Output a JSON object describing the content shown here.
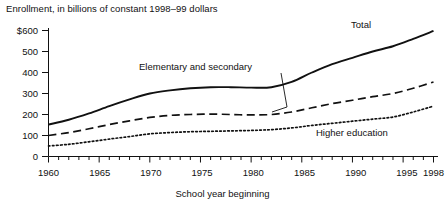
{
  "chart_data": {
    "type": "line",
    "title": "Enrollment, in billions of constant 1998–99 dollars",
    "xlabel": "School year beginning",
    "ylabel": "",
    "xlim": [
      1960,
      1998
    ],
    "ylim": [
      0,
      600
    ],
    "grid": false,
    "legend_position": "inline-annotations",
    "ytick_labels": [
      "$600",
      "500",
      "400",
      "300",
      "200",
      "100",
      "0"
    ],
    "ytick_values": [
      600,
      500,
      400,
      300,
      200,
      100,
      0
    ],
    "xtick_labels": [
      "1960",
      "1965",
      "1970",
      "1975",
      "1980",
      "1985",
      "1990",
      "1995",
      "1998"
    ],
    "xtick_values": [
      1960,
      1965,
      1970,
      1975,
      1980,
      1985,
      1990,
      1995,
      1998
    ],
    "x": [
      1960,
      1962,
      1964,
      1966,
      1968,
      1970,
      1972,
      1974,
      1976,
      1978,
      1980,
      1982,
      1984,
      1986,
      1988,
      1990,
      1992,
      1994,
      1996,
      1998
    ],
    "series": [
      {
        "name": "Total",
        "style": "solid",
        "values": [
          152,
          175,
          205,
          240,
          272,
          300,
          315,
          325,
          330,
          330,
          328,
          330,
          355,
          400,
          440,
          470,
          500,
          525,
          560,
          598
        ]
      },
      {
        "name": "Elementary and secondary",
        "style": "dashed",
        "values": [
          100,
          114,
          132,
          152,
          170,
          186,
          196,
          200,
          202,
          200,
          198,
          200,
          212,
          232,
          252,
          268,
          285,
          300,
          325,
          355
        ]
      },
      {
        "name": "Higher education",
        "style": "dotted",
        "values": [
          50,
          58,
          70,
          83,
          95,
          108,
          114,
          118,
          120,
          122,
          124,
          128,
          136,
          148,
          158,
          168,
          178,
          188,
          212,
          240
        ]
      }
    ],
    "annotations": [
      {
        "text": "Total",
        "series": "Total"
      },
      {
        "text": "Elementary and secondary",
        "series": "Elementary and secondary"
      },
      {
        "text": "Higher education",
        "series": "Higher education"
      }
    ]
  }
}
